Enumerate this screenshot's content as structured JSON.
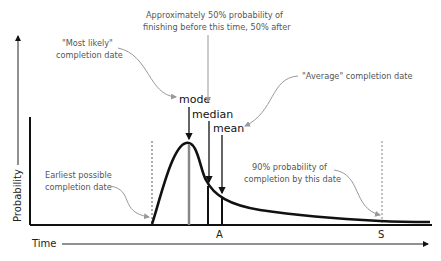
{
  "diagram": {
    "type": "probability-distribution-annotated",
    "axes": {
      "y_label": "Probability",
      "x_label": "Time",
      "x_ticks": [
        "A",
        "S"
      ]
    },
    "markers": {
      "mode": "mode",
      "median": "median",
      "mean": "mean"
    },
    "annotations": {
      "most_likely_line1": "\"Most likely\"",
      "most_likely_line2": "completion date",
      "median_note_line1": "Approximately 50% probability of",
      "median_note_line2": "finishing before this time, 50% after",
      "average_note": "\"Average\" completion date",
      "earliest_line1": "Earliest possible",
      "earliest_line2": "completion date",
      "p90_line1": "90% probability of",
      "p90_line2": "completion by this date"
    },
    "colors": {
      "curve": "#111111",
      "mode_line": "#888888",
      "annotation_text": "#555555",
      "annotation_arrow": "#999999"
    }
  }
}
